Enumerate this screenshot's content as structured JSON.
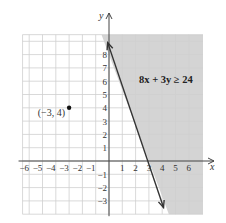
{
  "chart_data": {
    "type": "scatter",
    "title": "",
    "xlabel": "x",
    "ylabel": "y",
    "xlim": [
      -6.5,
      6.5
    ],
    "ylim": [
      -4,
      9.5
    ],
    "grid": true,
    "x_ticks": [
      -6,
      -5,
      -4,
      -3,
      -2,
      -1,
      1,
      2,
      3,
      4,
      5,
      6
    ],
    "x_tick_labels": [
      "−6",
      "−5",
      "−4",
      "−3",
      "−2",
      "−1",
      "1",
      "2",
      "3",
      "4",
      "5",
      "6"
    ],
    "y_ticks": [
      -3,
      -2,
      -1,
      1,
      2,
      3,
      4,
      5,
      6,
      7,
      8
    ],
    "y_tick_labels": [
      "−3",
      "−2",
      "−1",
      "1",
      "2",
      "3",
      "4",
      "5",
      "6",
      "7",
      "8"
    ],
    "boundary_line": {
      "equation": "8x + 3y = 24",
      "style": "solid",
      "points": [
        [
          -0.1,
          8.9
        ],
        [
          4.1,
          -3.5
        ]
      ],
      "intercepts": {
        "x": 3,
        "y": 8
      }
    },
    "shaded_region": {
      "inequality": "8x + 3y ≥ 24",
      "label": "8x + 3y ≥ 24",
      "side": "right of line",
      "color": "#d4d4d4"
    },
    "points": [
      {
        "x": -3,
        "y": 4,
        "label": "(−3, 4)"
      }
    ],
    "colors": {
      "grid": "#cfcfcf",
      "axis": "#444444",
      "line": "#333333",
      "shade": "#d4d4d4",
      "point": "#111111"
    }
  }
}
